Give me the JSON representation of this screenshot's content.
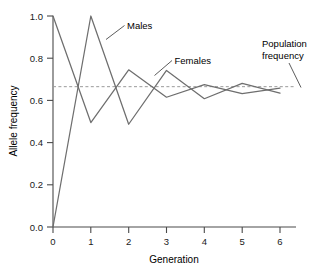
{
  "chart_data": {
    "type": "line",
    "title": "",
    "xlabel": "Generation",
    "ylabel": "Allele frequency",
    "xlim": [
      0,
      6
    ],
    "ylim": [
      0.0,
      1.0
    ],
    "xticks": [
      0,
      1,
      2,
      3,
      4,
      5,
      6
    ],
    "xtick_labels": [
      "0",
      "1",
      "2",
      "3",
      "4",
      "5",
      "6"
    ],
    "yticks": [
      0.0,
      0.2,
      0.4,
      0.6,
      0.8,
      1.0
    ],
    "ytick_labels": [
      "0.0",
      "0.2",
      "0.4",
      "0.6",
      "0.8",
      "1.0"
    ],
    "grid": false,
    "legend_position": "inline-annotations",
    "x": [
      0,
      1,
      2,
      3,
      4,
      5,
      6
    ],
    "series": [
      {
        "name": "Males",
        "color": "#6e6e6e",
        "values": [
          1.0,
          0.495,
          0.745,
          0.615,
          0.675,
          0.632,
          0.658
        ]
      },
      {
        "name": "Females",
        "color": "#6e6e6e",
        "values": [
          0.0,
          1.0,
          0.487,
          0.742,
          0.608,
          0.681,
          0.634
        ]
      }
    ],
    "reference_line": {
      "name": "Population frequency",
      "value": 0.665,
      "style": "dashed",
      "color": "#9a9a9a",
      "orientation": "horizontal"
    },
    "annotations": [
      {
        "text": "Males",
        "target_series": "Males",
        "leader": true
      },
      {
        "text": "Females",
        "target_series": "Females",
        "leader": true
      },
      {
        "text": "Population frequency",
        "target_series": "reference_line",
        "leader": true
      }
    ]
  },
  "labels": {
    "males": "Males",
    "females": "Females",
    "population_frequency_line1": "Population",
    "population_frequency_line2": "frequency",
    "x_axis_title": "Generation",
    "y_axis_title": "Allele frequency"
  },
  "axis": {
    "x_tick_0": "0",
    "x_tick_1": "1",
    "x_tick_2": "2",
    "x_tick_3": "3",
    "x_tick_4": "4",
    "x_tick_5": "5",
    "x_tick_6": "6",
    "y_tick_0": "0.0",
    "y_tick_1": "0.2",
    "y_tick_2": "0.4",
    "y_tick_3": "0.6",
    "y_tick_4": "0.8",
    "y_tick_5": "1.0"
  }
}
